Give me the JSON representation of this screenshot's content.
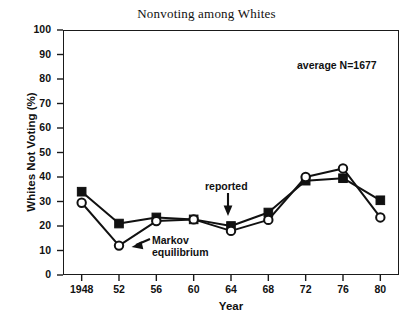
{
  "chart_data": {
    "type": "line",
    "title": "Nonvoting among Whites",
    "xlabel": "Year",
    "ylabel": "Whites Not Voting (%)",
    "categories": [
      "1948",
      "52",
      "56",
      "60",
      "64",
      "68",
      "72",
      "76",
      "80"
    ],
    "x_values": [
      1948,
      1952,
      1956,
      1960,
      1964,
      1968,
      1972,
      1976,
      1980
    ],
    "xlim": [
      1946,
      1982
    ],
    "ylim": [
      0,
      100
    ],
    "y_ticks": [
      "0",
      "10",
      "20",
      "30",
      "40",
      "50",
      "60",
      "70",
      "80",
      "90",
      "100"
    ],
    "y_tick_values": [
      0,
      10,
      20,
      30,
      40,
      50,
      60,
      70,
      80,
      90,
      100
    ],
    "grid": false,
    "legend": "none",
    "series": [
      {
        "name": "reported",
        "marker": "filled-square",
        "color": "#111111",
        "values": [
          34,
          21,
          23.5,
          22.7,
          20,
          25.5,
          38.5,
          39.5,
          30.5
        ]
      },
      {
        "name": "Markov equilibrium",
        "marker": "open-circle",
        "color": "#111111",
        "values": [
          29.5,
          12,
          22,
          22.7,
          18,
          22.5,
          40,
          43.5,
          23.5
        ]
      }
    ],
    "annotations": [
      {
        "name": "average-n",
        "text": "average N=1677"
      },
      {
        "name": "reported-label",
        "text": "reported"
      },
      {
        "name": "markov-label-line1",
        "text": "Markov"
      },
      {
        "name": "markov-label-line2",
        "text": "equilibrium"
      }
    ]
  }
}
